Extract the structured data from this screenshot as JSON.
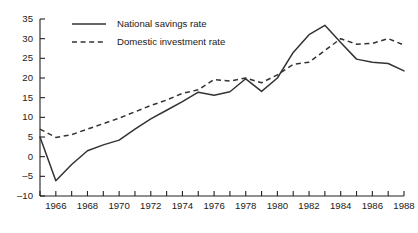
{
  "chart_data": {
    "type": "line",
    "title": "",
    "xlabel": "",
    "ylabel": "",
    "xlim": [
      1965,
      1988
    ],
    "ylim": [
      -10,
      35
    ],
    "grid": false,
    "legend_position": "top-center",
    "y_ticks": [
      35,
      30,
      25,
      20,
      15,
      10,
      5,
      0,
      -5,
      -10
    ],
    "y_tick_labels": [
      "35",
      "30",
      "25",
      "20",
      "15",
      "10",
      "5",
      "0",
      "-5",
      "-10"
    ],
    "x_ticks": [
      1966,
      1968,
      1970,
      1972,
      1974,
      1976,
      1978,
      1980,
      1982,
      1984,
      1986,
      1988
    ],
    "x_tick_labels": [
      "1966",
      "1968",
      "1970",
      "1972",
      "1974",
      "1976",
      "1978",
      "1980",
      "1982",
      "1984",
      "1986",
      "1988"
    ],
    "x_minor_ticks": [
      1965,
      1967,
      1969,
      1971,
      1973,
      1975,
      1977,
      1979,
      1981,
      1983,
      1985,
      1987
    ],
    "x": [
      1965,
      1966,
      1967,
      1968,
      1969,
      1970,
      1971,
      1972,
      1973,
      1974,
      1975,
      1976,
      1977,
      1978,
      1979,
      1980,
      1981,
      1982,
      1983,
      1984,
      1985,
      1986,
      1987,
      1988
    ],
    "series": [
      {
        "name": "National savings rate",
        "style": "solid",
        "color": "#333333",
        "values": [
          5.0,
          -6.1,
          -2.0,
          1.5,
          3.0,
          4.2,
          7.0,
          9.6,
          11.8,
          14.0,
          16.4,
          15.6,
          16.5,
          19.8,
          16.6,
          20.0,
          26.5,
          31.0,
          33.4,
          29.0,
          24.8,
          24.0,
          23.7,
          21.8
        ]
      },
      {
        "name": "Domestic investment rate",
        "style": "dashed",
        "color": "#333333",
        "values": [
          7.0,
          4.9,
          5.6,
          7.0,
          8.4,
          9.8,
          11.4,
          13.0,
          14.4,
          16.1,
          17.0,
          19.6,
          19.2,
          20.0,
          18.8,
          20.8,
          23.5,
          24.0,
          27.0,
          30.0,
          28.6,
          28.8,
          30.0,
          28.4
        ]
      }
    ],
    "series_right": [
      {
        "name": "National savings rate",
        "values_tail": [
          33.4,
          29.0,
          25.6,
          22.0,
          24.4,
          22.0,
          19.0,
          21.3,
          24.2,
          20.3
        ]
      }
    ]
  },
  "legend": {
    "entries": [
      {
        "label": "National savings rate",
        "style": "solid"
      },
      {
        "label": "Domestic investment rate",
        "style": "dashed"
      }
    ]
  }
}
